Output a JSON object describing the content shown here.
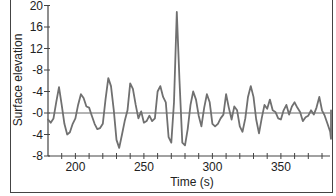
{
  "chart_data": {
    "type": "line",
    "title": "",
    "xlabel": "Time (s)",
    "ylabel": "Surface elevation",
    "xlim": [
      180,
      385
    ],
    "ylim": [
      -8,
      20
    ],
    "x_ticks": [
      200,
      250,
      300,
      350
    ],
    "x_tick_labels": [
      "200",
      "250",
      "300",
      "350"
    ],
    "x_minor_tick_step": 10,
    "y_ticks": [
      20,
      16,
      12,
      8,
      4,
      0,
      -4,
      -8
    ],
    "y_tick_labels": [
      "20",
      "16",
      "12",
      "-8",
      "-4",
      "-0",
      "-4",
      "-8"
    ],
    "grid": false,
    "zero_line": true,
    "line_color": "#6b6b6b",
    "series": [
      {
        "name": "Surface elevation",
        "x": [
          180,
          182,
          184,
          186,
          188,
          190,
          192,
          194,
          196,
          198,
          200,
          202,
          204,
          206,
          208,
          210,
          212,
          214,
          216,
          218,
          220,
          222,
          224,
          226,
          228,
          230,
          232,
          234,
          236,
          238,
          240,
          242,
          244,
          246,
          248,
          250,
          252,
          254,
          256,
          258,
          260,
          262,
          264,
          266,
          268,
          270,
          272,
          274,
          276,
          278,
          280,
          282,
          284,
          286,
          288,
          290,
          292,
          294,
          296,
          298,
          300,
          302,
          304,
          306,
          308,
          310,
          312,
          314,
          316,
          318,
          320,
          322,
          324,
          326,
          328,
          330,
          332,
          334,
          336,
          338,
          340,
          342,
          344,
          346,
          348,
          350,
          352,
          354,
          356,
          358,
          360,
          362,
          364,
          366,
          368,
          370,
          372,
          374,
          376,
          378,
          380,
          382,
          384
        ],
        "values": [
          -1.2,
          -1.8,
          -1.0,
          2.0,
          4.8,
          1.5,
          -2.0,
          -4.0,
          -3.6,
          -2.0,
          -1.0,
          1.5,
          3.5,
          2.8,
          1.2,
          1.0,
          -0.5,
          -2.0,
          -3.0,
          -2.8,
          -2.0,
          2.5,
          6.5,
          5.0,
          0.5,
          -5.0,
          -6.5,
          -4.0,
          -1.5,
          0.5,
          5.5,
          4.5,
          1.5,
          -1.0,
          0.3,
          -1.8,
          -1.5,
          -0.5,
          -1.5,
          -1.0,
          4.0,
          5.0,
          3.0,
          2.0,
          -4.5,
          -5.5,
          2.0,
          18.8,
          6.0,
          -5.5,
          -6.0,
          -3.0,
          1.5,
          4.0,
          2.5,
          -0.5,
          -2.5,
          1.0,
          3.5,
          2.0,
          -2.0,
          -2.5,
          -2.0,
          -1.0,
          -0.3,
          3.5,
          1.0,
          -1.2,
          1.2,
          0.5,
          -2.5,
          -3.5,
          -1.0,
          3.0,
          5.0,
          3.0,
          -1.2,
          -3.8,
          -1.0,
          1.5,
          0.8,
          2.5,
          0.5,
          0.2,
          -1.0,
          -1.2,
          0.5,
          1.5,
          -0.3,
          1.2,
          2.0,
          1.0,
          0.2,
          -1.5,
          -0.8,
          -0.5,
          0.5,
          -0.3,
          1.0,
          3.0,
          0.5,
          -0.5,
          -2.0
        ],
        "tail": {
          "x": [
            386,
            388,
            390
          ],
          "values": [
            -3.5,
            -4.8,
            0.5
          ]
        }
      }
    ]
  }
}
